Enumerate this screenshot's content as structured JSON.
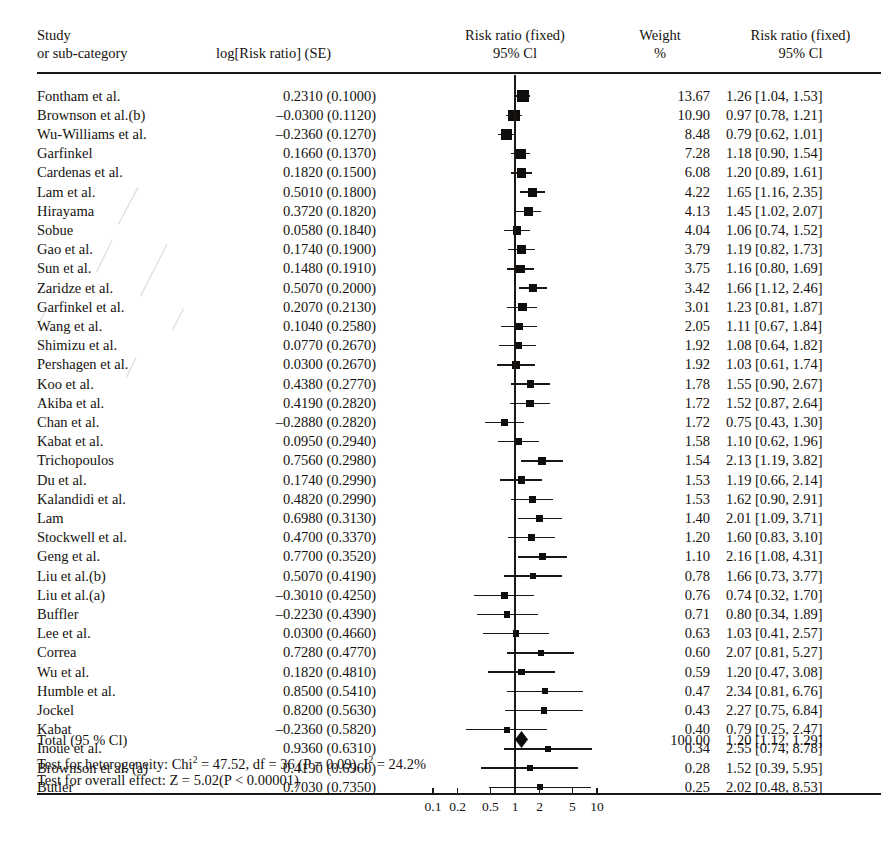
{
  "header": {
    "col_study_line1": "Study",
    "col_study_line2": "or sub-category",
    "col_se": "log[Risk ratio] (SE)",
    "col_plot_line1": "Risk ratio (fixed)",
    "col_plot_line2": "95% Cl",
    "col_weight_line1": "Weight",
    "col_weight_line2": "%",
    "col_rr_line1": "Risk ratio (fixed)",
    "col_rr_line2": "95% Cl"
  },
  "total": {
    "label": "Total (95 % Cl)",
    "heterogeneity": "Test for heterogeneity: Chi² = 47.52, df = 36 (P = 0.09), I² = 24.2%",
    "heterogeneity_parts": {
      "prefix": "Test for heterogeneity: Chi",
      "sup1": "2",
      "mid": " = 47.52, df = 36 (P = 0.09), I",
      "sup2": "2",
      "suffix": " = 24.2%"
    },
    "overall_effect": "Test for overall effect: Z = 5.02(P < 0.00001)",
    "weight": "100.00",
    "rr_ci": "1.20 [1.12, 1.29]",
    "rr": 1.2,
    "lcl": 1.12,
    "ucl": 1.29
  },
  "axis": {
    "ticks": [
      "0.1",
      "0.2",
      "0.5",
      "1",
      "2",
      "5",
      "10"
    ],
    "tick_values": [
      0.1,
      0.2,
      0.5,
      1,
      2,
      5,
      10
    ],
    "scale": "log10",
    "null_value": 1
  },
  "colors": {
    "ink": "#1a1714",
    "marker": "#100e0c",
    "paper": "#ffffff"
  },
  "chart_data": {
    "type": "forest",
    "title": "Risk ratio (fixed) 95% Cl",
    "xlabel": "",
    "ylabel": "",
    "xscale": "log10",
    "xlim": [
      0.07,
      16
    ],
    "grid": false,
    "null_line": 1,
    "effect_measure": "Risk ratio (fixed)",
    "model": "fixed",
    "columns": [
      "Study or sub-category",
      "log[Risk ratio] (SE)",
      "Weight %",
      "Risk ratio (fixed) 95% Cl"
    ],
    "studies": [
      {
        "study": "Fontham et al.",
        "se_text": "0.2310 (0.1000)",
        "logrr": 0.231,
        "se": 0.1,
        "weight": 13.67,
        "weight_text": "13.67",
        "rr_text": "1.26 [1.04, 1.53]",
        "rr": 1.26,
        "lcl": 1.04,
        "ucl": 1.53
      },
      {
        "study": "Brownson et al.(b)",
        "se_text": "–0.0300 (0.1120)",
        "logrr": -0.03,
        "se": 0.112,
        "weight": 10.9,
        "weight_text": "10.90",
        "rr_text": "0.97 [0.78, 1.21]",
        "rr": 0.97,
        "lcl": 0.78,
        "ucl": 1.21
      },
      {
        "study": "Wu-Williams et al.",
        "se_text": "–0.2360 (0.1270)",
        "logrr": -0.236,
        "se": 0.127,
        "weight": 8.48,
        "weight_text": "8.48",
        "rr_text": "0.79 [0.62, 1.01]",
        "rr": 0.79,
        "lcl": 0.62,
        "ucl": 1.01
      },
      {
        "study": "Garfinkel",
        "se_text": "0.1660 (0.1370)",
        "logrr": 0.166,
        "se": 0.137,
        "weight": 7.28,
        "weight_text": "7.28",
        "rr_text": "1.18 [0.90, 1.54]",
        "rr": 1.18,
        "lcl": 0.9,
        "ucl": 1.54
      },
      {
        "study": "Cardenas et al.",
        "se_text": "0.1820 (0.1500)",
        "logrr": 0.182,
        "se": 0.15,
        "weight": 6.08,
        "weight_text": "6.08",
        "rr_text": "1.20 [0.89, 1.61]",
        "rr": 1.2,
        "lcl": 0.89,
        "ucl": 1.61
      },
      {
        "study": "Lam et al.",
        "se_text": "0.5010 (0.1800)",
        "logrr": 0.501,
        "se": 0.18,
        "weight": 4.22,
        "weight_text": "4.22",
        "rr_text": "1.65 [1.16, 2.35]",
        "rr": 1.65,
        "lcl": 1.16,
        "ucl": 2.35
      },
      {
        "study": "Hirayama",
        "se_text": "0.3720 (0.1820)",
        "logrr": 0.372,
        "se": 0.182,
        "weight": 4.13,
        "weight_text": "4.13",
        "rr_text": "1.45 [1.02, 2.07]",
        "rr": 1.45,
        "lcl": 1.02,
        "ucl": 2.07
      },
      {
        "study": "Sobue",
        "se_text": "0.0580 (0.1840)",
        "logrr": 0.058,
        "se": 0.184,
        "weight": 4.04,
        "weight_text": "4.04",
        "rr_text": "1.06 [0.74, 1.52]",
        "rr": 1.06,
        "lcl": 0.74,
        "ucl": 1.52
      },
      {
        "study": "Gao et al.",
        "se_text": "0.1740 (0.1900)",
        "logrr": 0.174,
        "se": 0.19,
        "weight": 3.79,
        "weight_text": "3.79",
        "rr_text": "1.19 [0.82, 1.73]",
        "rr": 1.19,
        "lcl": 0.82,
        "ucl": 1.73
      },
      {
        "study": "Sun et al.",
        "se_text": "0.1480 (0.1910)",
        "logrr": 0.148,
        "se": 0.191,
        "weight": 3.75,
        "weight_text": "3.75",
        "rr_text": "1.16 [0.80, 1.69]",
        "rr": 1.16,
        "lcl": 0.8,
        "ucl": 1.69
      },
      {
        "study": "Zaridze et al.",
        "se_text": "0.5070 (0.2000)",
        "logrr": 0.507,
        "se": 0.2,
        "weight": 3.42,
        "weight_text": "3.42",
        "rr_text": "1.66 [1.12, 2.46]",
        "rr": 1.66,
        "lcl": 1.12,
        "ucl": 2.46
      },
      {
        "study": "Garfinkel et al.",
        "se_text": "0.2070 (0.2130)",
        "logrr": 0.207,
        "se": 0.213,
        "weight": 3.01,
        "weight_text": "3.01",
        "rr_text": "1.23 [0.81, 1.87]",
        "rr": 1.23,
        "lcl": 0.81,
        "ucl": 1.87
      },
      {
        "study": "Wang et al.",
        "se_text": "0.1040 (0.2580)",
        "logrr": 0.104,
        "se": 0.258,
        "weight": 2.05,
        "weight_text": "2.05",
        "rr_text": "1.11 [0.67, 1.84]",
        "rr": 1.11,
        "lcl": 0.67,
        "ucl": 1.84
      },
      {
        "study": "Shimizu et al.",
        "se_text": "0.0770 (0.2670)",
        "logrr": 0.077,
        "se": 0.267,
        "weight": 1.92,
        "weight_text": "1.92",
        "rr_text": "1.08 [0.64, 1.82]",
        "rr": 1.08,
        "lcl": 0.64,
        "ucl": 1.82
      },
      {
        "study": "Pershagen et al.",
        "se_text": "0.0300 (0.2670)",
        "logrr": 0.03,
        "se": 0.267,
        "weight": 1.92,
        "weight_text": "1.92",
        "rr_text": "1.03 [0.61, 1.74]",
        "rr": 1.03,
        "lcl": 0.61,
        "ucl": 1.74
      },
      {
        "study": "Koo et al.",
        "se_text": "0.4380 (0.2770)",
        "logrr": 0.438,
        "se": 0.277,
        "weight": 1.78,
        "weight_text": "1.78",
        "rr_text": "1.55 [0.90, 2.67]",
        "rr": 1.55,
        "lcl": 0.9,
        "ucl": 2.67
      },
      {
        "study": "Akiba et al.",
        "se_text": "0.4190 (0.2820)",
        "logrr": 0.419,
        "se": 0.282,
        "weight": 1.72,
        "weight_text": "1.72",
        "rr_text": "1.52 [0.87, 2.64]",
        "rr": 1.52,
        "lcl": 0.87,
        "ucl": 2.64
      },
      {
        "study": "Chan et al.",
        "se_text": "–0.2880 (0.2820)",
        "logrr": -0.288,
        "se": 0.282,
        "weight": 1.72,
        "weight_text": "1.72",
        "rr_text": "0.75 [0.43, 1.30]",
        "rr": 0.75,
        "lcl": 0.43,
        "ucl": 1.3
      },
      {
        "study": "Kabat et al.",
        "se_text": "0.0950 (0.2940)",
        "logrr": 0.095,
        "se": 0.294,
        "weight": 1.58,
        "weight_text": "1.58",
        "rr_text": "1.10 [0.62, 1.96]",
        "rr": 1.1,
        "lcl": 0.62,
        "ucl": 1.96
      },
      {
        "study": "Trichopoulos",
        "se_text": "0.7560 (0.2980)",
        "logrr": 0.756,
        "se": 0.298,
        "weight": 1.54,
        "weight_text": "1.54",
        "rr_text": "2.13 [1.19, 3.82]",
        "rr": 2.13,
        "lcl": 1.19,
        "ucl": 3.82
      },
      {
        "study": "Du et al.",
        "se_text": "0.1740 (0.2990)",
        "logrr": 0.174,
        "se": 0.299,
        "weight": 1.53,
        "weight_text": "1.53",
        "rr_text": "1.19 [0.66, 2.14]",
        "rr": 1.19,
        "lcl": 0.66,
        "ucl": 2.14
      },
      {
        "study": "Kalandidi et al.",
        "se_text": "0.4820 (0.2990)",
        "logrr": 0.482,
        "se": 0.299,
        "weight": 1.53,
        "weight_text": "1.53",
        "rr_text": "1.62 [0.90, 2.91]",
        "rr": 1.62,
        "lcl": 0.9,
        "ucl": 2.91
      },
      {
        "study": "Lam",
        "se_text": "0.6980 (0.3130)",
        "logrr": 0.698,
        "se": 0.313,
        "weight": 1.4,
        "weight_text": "1.40",
        "rr_text": "2.01 [1.09, 3.71]",
        "rr": 2.01,
        "lcl": 1.09,
        "ucl": 3.71
      },
      {
        "study": "Stockwell et al.",
        "se_text": "0.4700 (0.3370)",
        "logrr": 0.47,
        "se": 0.337,
        "weight": 1.2,
        "weight_text": "1.20",
        "rr_text": "1.60 [0.83, 3.10]",
        "rr": 1.6,
        "lcl": 0.83,
        "ucl": 3.1
      },
      {
        "study": "Geng et al.",
        "se_text": "0.7700 (0.3520)",
        "logrr": 0.77,
        "se": 0.352,
        "weight": 1.1,
        "weight_text": "1.10",
        "rr_text": "2.16 [1.08, 4.31]",
        "rr": 2.16,
        "lcl": 1.08,
        "ucl": 4.31
      },
      {
        "study": "Liu et al.(b)",
        "se_text": "0.5070 (0.4190)",
        "logrr": 0.507,
        "se": 0.419,
        "weight": 0.78,
        "weight_text": "0.78",
        "rr_text": "1.66 [0.73, 3.77]",
        "rr": 1.66,
        "lcl": 0.73,
        "ucl": 3.77
      },
      {
        "study": "Liu et al.(a)",
        "se_text": "–0.3010 (0.4250)",
        "logrr": -0.301,
        "se": 0.425,
        "weight": 0.76,
        "weight_text": "0.76",
        "rr_text": "0.74 [0.32, 1.70]",
        "rr": 0.74,
        "lcl": 0.32,
        "ucl": 1.7
      },
      {
        "study": "Buffler",
        "se_text": "–0.2230 (0.4390)",
        "logrr": -0.223,
        "se": 0.439,
        "weight": 0.71,
        "weight_text": "0.71",
        "rr_text": "0.80 [0.34, 1.89]",
        "rr": 0.8,
        "lcl": 0.34,
        "ucl": 1.89
      },
      {
        "study": "Lee et al.",
        "se_text": "0.0300 (0.4660)",
        "logrr": 0.03,
        "se": 0.466,
        "weight": 0.63,
        "weight_text": "0.63",
        "rr_text": "1.03 [0.41, 2.57]",
        "rr": 1.03,
        "lcl": 0.41,
        "ucl": 2.57
      },
      {
        "study": "Correa",
        "se_text": "0.7280 (0.4770)",
        "logrr": 0.728,
        "se": 0.477,
        "weight": 0.6,
        "weight_text": "0.60",
        "rr_text": "2.07 [0.81, 5.27]",
        "rr": 2.07,
        "lcl": 0.81,
        "ucl": 5.27
      },
      {
        "study": "Wu et al.",
        "se_text": "0.1820 (0.4810)",
        "logrr": 0.182,
        "se": 0.481,
        "weight": 0.59,
        "weight_text": "0.59",
        "rr_text": "1.20 [0.47, 3.08]",
        "rr": 1.2,
        "lcl": 0.47,
        "ucl": 3.08
      },
      {
        "study": "Humble et al.",
        "se_text": "0.8500 (0.5410)",
        "logrr": 0.85,
        "se": 0.541,
        "weight": 0.47,
        "weight_text": "0.47",
        "rr_text": "2.34 [0.81, 6.76]",
        "rr": 2.34,
        "lcl": 0.81,
        "ucl": 6.76
      },
      {
        "study": "Jockel",
        "se_text": "0.8200 (0.5630)",
        "logrr": 0.82,
        "se": 0.563,
        "weight": 0.43,
        "weight_text": "0.43",
        "rr_text": "2.27 [0.75, 6.84]",
        "rr": 2.27,
        "lcl": 0.75,
        "ucl": 6.84
      },
      {
        "study": "Kabat",
        "se_text": "–0.2360 (0.5820)",
        "logrr": -0.236,
        "se": 0.582,
        "weight": 0.4,
        "weight_text": "0.40",
        "rr_text": "0.79 [0.25, 2.47]",
        "rr": 0.79,
        "lcl": 0.25,
        "ucl": 2.47
      },
      {
        "study": "Inoue et al.",
        "se_text": "0.9360 (0.6310)",
        "logrr": 0.936,
        "se": 0.631,
        "weight": 0.34,
        "weight_text": "0.34",
        "rr_text": "2.55 [0.74, 8.78]",
        "rr": 2.55,
        "lcl": 0.74,
        "ucl": 8.78
      },
      {
        "study": "Brownson et al. (a)",
        "se_text": "0.4190 (0.6960)",
        "logrr": 0.419,
        "se": 0.696,
        "weight": 0.28,
        "weight_text": "0.28",
        "rr_text": "1.52 [0.39, 5.95]",
        "rr": 1.52,
        "lcl": 0.39,
        "ucl": 5.95
      },
      {
        "study": "Butler",
        "se_text": "0.7030 (0.7350)",
        "logrr": 0.703,
        "se": 0.735,
        "weight": 0.25,
        "weight_text": "0.25",
        "rr_text": "2.02 [0.48, 8.53]",
        "rr": 2.02,
        "lcl": 0.48,
        "ucl": 8.53
      }
    ]
  }
}
